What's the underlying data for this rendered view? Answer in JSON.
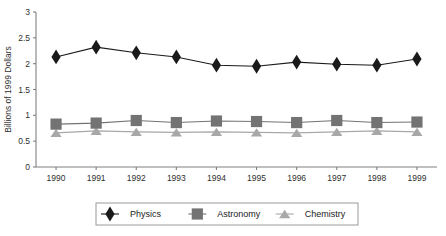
{
  "chart_data": {
    "type": "line",
    "title": "",
    "xlabel": "",
    "ylabel": "Billions of 1999 Dollars",
    "categories": [
      "1990",
      "1991",
      "1992",
      "1993",
      "1994",
      "1995",
      "1996",
      "1997",
      "1998",
      "1999"
    ],
    "x": [
      1990,
      1991,
      1992,
      1993,
      1994,
      1995,
      1996,
      1997,
      1998,
      1999
    ],
    "ylim": [
      0,
      3
    ],
    "yticks": [
      0,
      0.5,
      1.0,
      1.5,
      2.0,
      2.5,
      3.0
    ],
    "ytick_labels": [
      "0",
      "0.5",
      "1",
      "1.5",
      "2",
      "2.5",
      "3"
    ],
    "grid": false,
    "legend_position": "bottom",
    "series": [
      {
        "name": "Physics",
        "marker": "diamond",
        "color": "#1a1a1a",
        "values": [
          2.13,
          2.32,
          2.21,
          2.13,
          1.97,
          1.95,
          2.03,
          1.99,
          1.97,
          2.09
        ]
      },
      {
        "name": "Astronomy",
        "marker": "square",
        "color": "#737373",
        "values": [
          0.83,
          0.85,
          0.9,
          0.86,
          0.89,
          0.88,
          0.86,
          0.9,
          0.86,
          0.87
        ]
      },
      {
        "name": "Chemistry",
        "marker": "triangle",
        "color": "#a8a8a8",
        "values": [
          0.66,
          0.7,
          0.68,
          0.67,
          0.68,
          0.67,
          0.66,
          0.68,
          0.7,
          0.68
        ]
      }
    ]
  },
  "legend": {
    "items": [
      {
        "label": "Physics",
        "color": "#1a1a1a",
        "marker": "diamond"
      },
      {
        "label": "Astronomy",
        "color": "#737373",
        "marker": "square"
      },
      {
        "label": "Chemistry",
        "color": "#a8a8a8",
        "marker": "triangle"
      }
    ]
  },
  "axes": {
    "y_title": "Billions of 1999 Dollars"
  }
}
